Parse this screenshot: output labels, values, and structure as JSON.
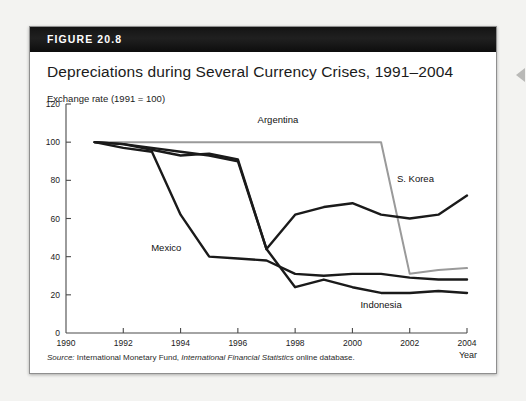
{
  "figure": {
    "number_label": "FIGURE 20.8",
    "title": "Depreciations during Several Currency Crises, 1991–2004",
    "axis_caption": "Exchange rate (1991 = 100)",
    "source_prefix": "Source:",
    "source_text_1": " International Monetary Fund, ",
    "source_italic": "International Financial Statistics",
    "source_text_2": " online database."
  },
  "colors": {
    "header_bar": "#141414",
    "card_border": "#8f8f8f",
    "page_background": "#f3f3f1",
    "argentina_line": "#9a9a9a",
    "dark_line": "#1a1a1a",
    "axis": "#4a4a4a",
    "text": "#1b1b1b"
  },
  "chart_data": {
    "type": "line",
    "title": "Depreciations during Several Currency Crises, 1991–2004",
    "xlabel": "Year",
    "ylabel": "Exchange rate (1991 = 100)",
    "xlim": [
      1990,
      2004
    ],
    "ylim": [
      0,
      120
    ],
    "xticks": [
      1990,
      1992,
      1994,
      1996,
      1998,
      2000,
      2002,
      2004
    ],
    "xtick_labels": [
      "1990",
      "1992",
      "1994",
      "1996",
      "1998",
      "2000",
      "2002",
      "2004"
    ],
    "yticks": [
      0,
      20,
      40,
      60,
      80,
      100,
      120
    ],
    "ytick_labels": [
      "0",
      "20",
      "40",
      "60",
      "80",
      "100",
      "120"
    ],
    "grid": false,
    "legend": "inline-labels",
    "x": [
      1991,
      1992,
      1993,
      1994,
      1995,
      1996,
      1997,
      1998,
      1999,
      2000,
      2001,
      2002,
      2003,
      2004
    ],
    "series": [
      {
        "name": "Argentina",
        "color": "#9a9a9a",
        "label_x": 1997.4,
        "label_y": 110,
        "values": [
          100,
          100,
          100,
          100,
          100,
          100,
          100,
          100,
          100,
          100,
          100,
          31,
          33,
          34
        ]
      },
      {
        "name": "Mexico",
        "color": "#1a1a1a",
        "label_x": 1993.5,
        "label_y": 43,
        "values": [
          100,
          97,
          95,
          62,
          40,
          39,
          38,
          31,
          30,
          31,
          31,
          29,
          28,
          28
        ]
      },
      {
        "name": "S. Korea",
        "color": "#1a1a1a",
        "label_x": 2002.2,
        "label_y": 79,
        "values": [
          100,
          99,
          96,
          93,
          94,
          91,
          44,
          62,
          66,
          68,
          62,
          60,
          62,
          72
        ]
      },
      {
        "name": "Indonesia",
        "color": "#1a1a1a",
        "label_x": 2001.0,
        "label_y": 13,
        "values": [
          100,
          99,
          97,
          95,
          93,
          90,
          44,
          24,
          28,
          24,
          21,
          21,
          22,
          21
        ]
      }
    ]
  }
}
